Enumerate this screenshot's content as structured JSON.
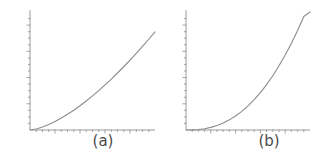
{
  "figure": {
    "background_color": "#ffffff",
    "line_color": "#8c8c8c",
    "axis_color": "#9a9a9a",
    "caption_color": "#4a4a4a",
    "panel_count": 2
  },
  "panels": [
    {
      "caption": "(a)",
      "axis": {
        "x_ticks_visible": true,
        "y_ticks_visible": true,
        "x_tick_count": 19,
        "y_tick_count": 17,
        "x_tick_labels": [],
        "y_tick_labels": [],
        "grid": false
      }
    },
    {
      "caption": "(b)",
      "axis": {
        "x_ticks_visible": true,
        "y_ticks_visible": true,
        "x_tick_count": 19,
        "y_tick_count": 17,
        "x_tick_labels": [],
        "y_tick_labels": [],
        "grid": false
      }
    }
  ],
  "chart_data": [
    {
      "type": "line",
      "title": "(a)",
      "xlabel": "",
      "ylabel": "",
      "xlim": [
        0,
        1
      ],
      "ylim": [
        0,
        1
      ],
      "grid": false,
      "legend": "none",
      "series": [
        {
          "name": "curve-a",
          "color": "#8c8c8c",
          "x": [
            0.0,
            0.05,
            0.1,
            0.15,
            0.2,
            0.25,
            0.3,
            0.35,
            0.4,
            0.45,
            0.5,
            0.55,
            0.6,
            0.65,
            0.7,
            0.75,
            0.8,
            0.85,
            0.9,
            0.95,
            1.0
          ],
          "y": [
            0.0,
            0.008,
            0.025,
            0.046,
            0.072,
            0.101,
            0.133,
            0.168,
            0.206,
            0.246,
            0.289,
            0.334,
            0.382,
            0.431,
            0.483,
            0.536,
            0.592,
            0.649,
            0.708,
            0.769,
            0.832
          ]
        }
      ]
    },
    {
      "type": "line",
      "title": "(b)",
      "xlabel": "",
      "ylabel": "",
      "xlim": [
        0,
        1
      ],
      "ylim": [
        0,
        1
      ],
      "grid": false,
      "legend": "none",
      "series": [
        {
          "name": "curve-b",
          "color": "#8c8c8c",
          "x": [
            0.0,
            0.05,
            0.1,
            0.15,
            0.2,
            0.25,
            0.3,
            0.35,
            0.4,
            0.45,
            0.5,
            0.55,
            0.6,
            0.65,
            0.7,
            0.75,
            0.8,
            0.85,
            0.9,
            0.95,
            1.0
          ],
          "y": [
            0.0,
            0.001,
            0.004,
            0.011,
            0.022,
            0.038,
            0.059,
            0.086,
            0.119,
            0.158,
            0.204,
            0.257,
            0.317,
            0.385,
            0.46,
            0.544,
            0.635,
            0.735,
            0.844,
            0.962,
            1.0
          ]
        }
      ]
    }
  ]
}
